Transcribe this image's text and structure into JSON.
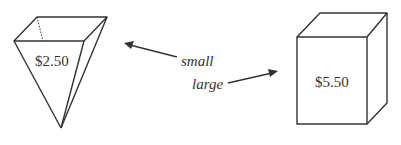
{
  "containers": [
    {
      "shape": "inverted-pyramid",
      "price": "$2.50"
    },
    {
      "shape": "rectangular-box",
      "price": "$5.50"
    }
  ],
  "labels": {
    "small": "small",
    "large": "large"
  },
  "colors": {
    "ink": "#333333",
    "background": "#ffffff"
  }
}
